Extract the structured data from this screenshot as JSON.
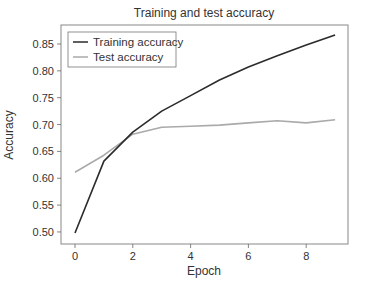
{
  "chart_data": {
    "type": "line",
    "title": "Training and test accuracy",
    "xlabel": "Epoch",
    "ylabel": "Accuracy",
    "x": [
      0,
      1,
      2,
      3,
      4,
      5,
      6,
      7,
      8,
      9
    ],
    "series": [
      {
        "name": "Training accuracy",
        "color": "#2b2b2b",
        "values": [
          0.498,
          0.632,
          0.686,
          0.725,
          0.754,
          0.783,
          0.807,
          0.828,
          0.848,
          0.867
        ]
      },
      {
        "name": "Test accuracy",
        "color": "#aaaaaa",
        "values": [
          0.611,
          0.643,
          0.682,
          0.695,
          0.697,
          0.699,
          0.703,
          0.707,
          0.703,
          0.709
        ]
      }
    ],
    "xticks": [
      "0",
      "2",
      "4",
      "6",
      "8"
    ],
    "yticks": [
      "0.50",
      "0.55",
      "0.60",
      "0.65",
      "0.70",
      "0.75",
      "0.80",
      "0.85"
    ],
    "xlim": [
      -0.5,
      9.45
    ],
    "ylim": [
      0.475,
      0.885
    ],
    "grid": false,
    "legend_position": "upper left"
  }
}
